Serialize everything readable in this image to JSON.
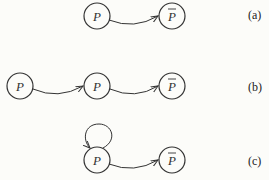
{
  "diagram": {
    "colors": {
      "stroke": "#333333",
      "background": "#fcfcf9"
    },
    "panels": [
      {
        "label": "(a)",
        "nodes": [
          {
            "id": "a1",
            "text": "P",
            "bar": false
          },
          {
            "id": "a2",
            "text": "P",
            "bar": true
          }
        ],
        "edges": [
          {
            "from": "a1",
            "to": "a2"
          }
        ]
      },
      {
        "label": "(b)",
        "nodes": [
          {
            "id": "b1",
            "text": "P",
            "bar": false
          },
          {
            "id": "b2",
            "text": "P",
            "bar": false
          },
          {
            "id": "b3",
            "text": "P",
            "bar": true
          }
        ],
        "edges": [
          {
            "from": "b1",
            "to": "b2"
          },
          {
            "from": "b2",
            "to": "b3"
          }
        ]
      },
      {
        "label": "(c)",
        "nodes": [
          {
            "id": "c1",
            "text": "P",
            "bar": false
          },
          {
            "id": "c2",
            "text": "P",
            "bar": true
          }
        ],
        "edges": [
          {
            "from": "c1",
            "to": "c1",
            "self_loop": true
          },
          {
            "from": "c1",
            "to": "c2"
          }
        ]
      }
    ]
  }
}
